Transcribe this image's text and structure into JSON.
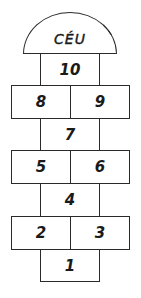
{
  "colors": {
    "line": "#2a2a2a",
    "text": "#1a1a1a",
    "background": "#ffffff"
  },
  "dome": {
    "label": "CÉU"
  },
  "squares": [
    {
      "id": "s10",
      "label": "10"
    },
    {
      "id": "s8",
      "label": "8"
    },
    {
      "id": "s9",
      "label": "9"
    },
    {
      "id": "s7",
      "label": "7"
    },
    {
      "id": "s5",
      "label": "5"
    },
    {
      "id": "s6",
      "label": "6"
    },
    {
      "id": "s4",
      "label": "4"
    },
    {
      "id": "s2",
      "label": "2"
    },
    {
      "id": "s3",
      "label": "3"
    },
    {
      "id": "s1",
      "label": "1"
    }
  ]
}
